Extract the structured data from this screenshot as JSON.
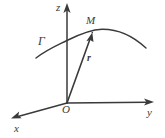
{
  "figure": {
    "type": "diagram",
    "background_color": "#ffffff",
    "stroke_color": "#3a3a3a",
    "axes": [
      {
        "id": "z",
        "label": "z",
        "direction": "vertical-up",
        "origin_px": [
          67,
          103
        ],
        "tip_px": [
          67,
          5
        ],
        "arrow": true
      },
      {
        "id": "y",
        "label": "y",
        "direction": "horizontal-right",
        "origin_px": [
          67,
          103
        ],
        "tip_px": [
          153,
          102
        ],
        "arrow": true
      },
      {
        "id": "x",
        "label": "x",
        "direction": "down-left-oblique",
        "origin_px": [
          67,
          103
        ],
        "tip_px": [
          12,
          118
        ],
        "arrow": true
      }
    ],
    "origin": {
      "label": "O",
      "point_px": [
        67,
        103
      ]
    },
    "curve": {
      "label": "Γ",
      "label_position_px": [
        38,
        35
      ],
      "path_points_px": [
        [
          36,
          58
        ],
        [
          62,
          43
        ],
        [
          100,
          29
        ],
        [
          126,
          33
        ],
        [
          146,
          48
        ]
      ],
      "arrow": false
    },
    "point": {
      "label": "M",
      "point_px": [
        92,
        33
      ],
      "label_position_px": [
        86,
        15
      ]
    },
    "vector": {
      "label": "r",
      "bold": true,
      "from_px": [
        67,
        103
      ],
      "to_px": [
        92,
        33
      ],
      "label_position_px": [
        87,
        53
      ],
      "arrow": true
    }
  }
}
